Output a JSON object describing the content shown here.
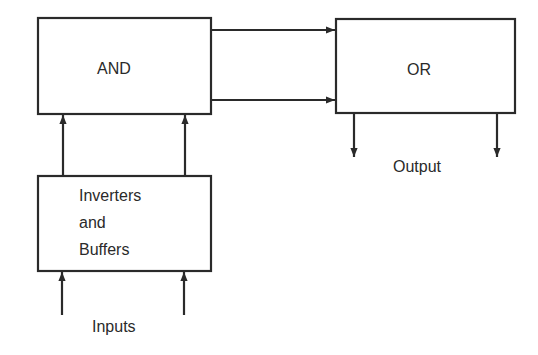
{
  "diagram": {
    "blocks": {
      "and": {
        "label": "AND"
      },
      "or": {
        "label": "OR"
      },
      "inverters": {
        "lines": [
          "Inverters",
          "and",
          "Buffers"
        ]
      }
    },
    "labels": {
      "inputs": "Inputs",
      "output": "Output"
    },
    "connections": [
      {
        "from": "inputs",
        "to": "inverters",
        "count": 2
      },
      {
        "from": "inverters",
        "to": "and",
        "count": 2
      },
      {
        "from": "and",
        "to": "or",
        "count": 2
      },
      {
        "from": "or",
        "to": "output",
        "count": 2
      }
    ],
    "colors": {
      "stroke": "#2a2a2a",
      "background": "#ffffff"
    }
  }
}
